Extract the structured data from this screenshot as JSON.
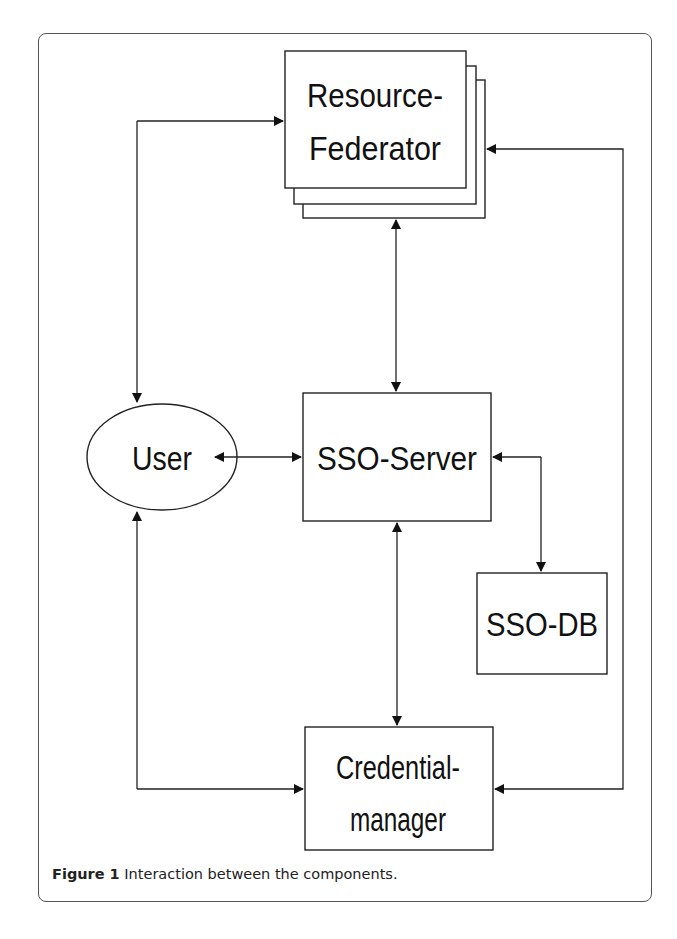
{
  "figure": {
    "caption_label": "Figure 1",
    "caption_text": " Interaction between the components."
  },
  "nodes": {
    "resource_federator": {
      "line1": "Resource-",
      "line2": "Federator",
      "shape": "stacked-rectangles"
    },
    "user": {
      "label": "User",
      "shape": "ellipse"
    },
    "sso_server": {
      "label": "SSO-Server",
      "shape": "rectangle"
    },
    "sso_db": {
      "label": "SSO-DB",
      "shape": "rectangle"
    },
    "credential_manager": {
      "line1": "Credential-",
      "line2": "manager",
      "shape": "rectangle"
    }
  },
  "edges": [
    {
      "from": "User",
      "to": "Resource-Federator",
      "direction": "bidirectional"
    },
    {
      "from": "User",
      "to": "SSO-Server",
      "direction": "bidirectional"
    },
    {
      "from": "User",
      "to": "Credential-manager",
      "direction": "bidirectional"
    },
    {
      "from": "Resource-Federator",
      "to": "SSO-Server",
      "direction": "bidirectional"
    },
    {
      "from": "SSO-Server",
      "to": "SSO-DB",
      "direction": "bidirectional"
    },
    {
      "from": "SSO-Server",
      "to": "Credential-manager",
      "direction": "bidirectional"
    },
    {
      "from": "Credential-manager",
      "to": "Resource-Federator",
      "direction": "bidirectional"
    }
  ],
  "colors": {
    "stroke": "#222222",
    "background": "#ffffff"
  }
}
